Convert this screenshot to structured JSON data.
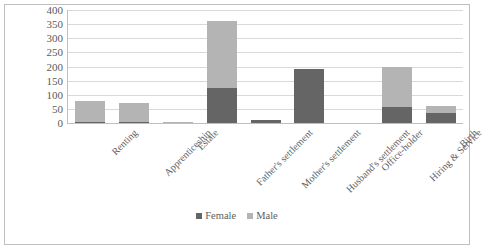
{
  "chart_data": {
    "type": "bar",
    "stacked": true,
    "title": "",
    "subtitle": "",
    "xlabel": "",
    "ylabel": "",
    "ylim": [
      0,
      400
    ],
    "ytick_step": 50,
    "yticks": [
      "400",
      "350",
      "300",
      "250",
      "200",
      "150",
      "100",
      "50",
      "0"
    ],
    "grid": true,
    "legend_position": "bottom",
    "categories": [
      "Renting",
      "Apprenticeship",
      "Estate",
      "Father's settlement",
      "Mother's settlement",
      "Husband's settlement",
      "Office-holder",
      "Hiring & Service",
      "Birth"
    ],
    "series": [
      {
        "name": "Female",
        "color": "#656565",
        "values": [
          5,
          4,
          0,
          123,
          12,
          190,
          0,
          58,
          36
        ]
      },
      {
        "name": "Male",
        "color": "#b4b4b4",
        "values": [
          72,
          67,
          4,
          237,
          0,
          0,
          0,
          142,
          26
        ]
      }
    ],
    "totals": [
      77,
      71,
      4,
      360,
      12,
      190,
      0,
      200,
      62
    ]
  },
  "legend": {
    "items": [
      {
        "label": "Female",
        "color": "#656565"
      },
      {
        "label": "Male",
        "color": "#b4b4b4"
      }
    ]
  }
}
